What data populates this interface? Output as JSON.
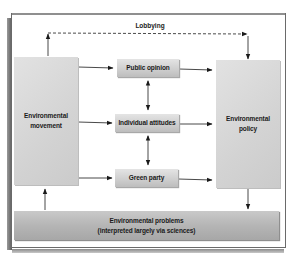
{
  "diagram": {
    "lobbying_label": "Lobbying",
    "nodes": {
      "movement": {
        "line1": "Environmental",
        "line2": "movement"
      },
      "policy": {
        "line1": "Environmental",
        "line2": "policy"
      },
      "public_opinion": {
        "label": "Public opinion"
      },
      "individual_attitudes": {
        "label": "Individual attitudes"
      },
      "green_party": {
        "label": "Green party"
      },
      "problems": {
        "line1": "Environmental problems",
        "line2": "(interpreted largely via sciences)"
      }
    },
    "edges": [
      {
        "from": "Environmental movement",
        "to": "Public opinion",
        "style": "solid"
      },
      {
        "from": "Environmental movement",
        "to": "Individual attitudes",
        "style": "solid"
      },
      {
        "from": "Environmental movement",
        "to": "Green party",
        "style": "solid"
      },
      {
        "from": "Public opinion",
        "to": "Environmental policy",
        "style": "solid"
      },
      {
        "from": "Individual attitudes",
        "to": "Environmental policy",
        "style": "solid"
      },
      {
        "from": "Green party",
        "to": "Environmental policy",
        "style": "solid"
      },
      {
        "from": "Public opinion",
        "to": "Individual attitudes",
        "style": "bidirectional"
      },
      {
        "from": "Individual attitudes",
        "to": "Green party",
        "style": "bidirectional"
      },
      {
        "from": "Environmental movement",
        "to": "Environmental policy",
        "style": "dashed",
        "label": "Lobbying"
      },
      {
        "from": "Environmental policy",
        "to": "Environmental problems",
        "style": "solid"
      },
      {
        "from": "Environmental problems",
        "to": "Environmental movement",
        "style": "solid"
      }
    ],
    "colors": {
      "box_light": "#d6d6d6",
      "box_dark": "#b0b0b0",
      "arrow": "#1a1a1a",
      "frame_border": "#6a6a6a"
    }
  }
}
